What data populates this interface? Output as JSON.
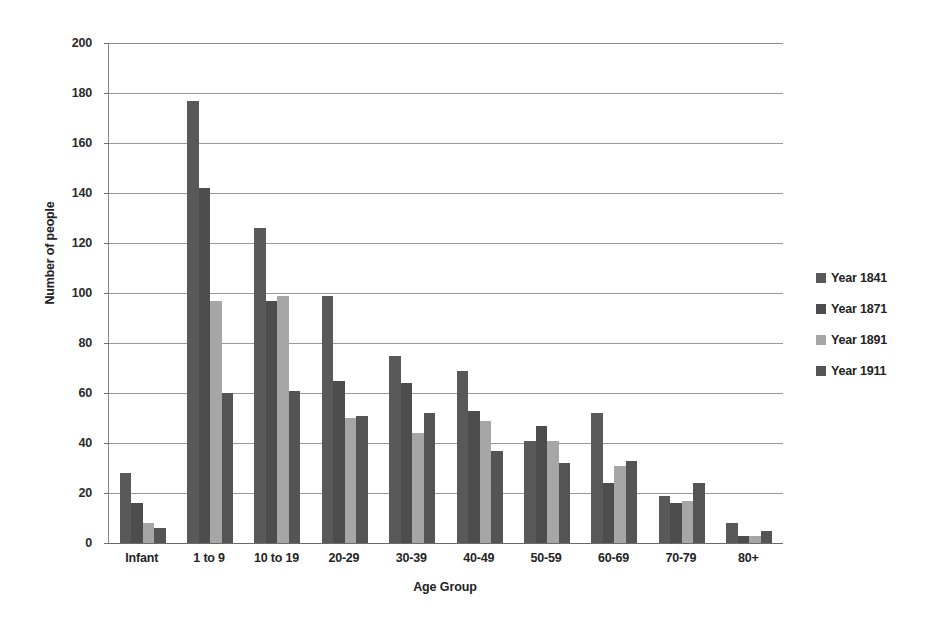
{
  "chart_data": {
    "type": "bar",
    "title": "",
    "xlabel": "Age Group",
    "ylabel": "Number of people",
    "categories": [
      "Infant",
      "1 to 9",
      "10 to 19",
      "20-29",
      "30-39",
      "40-49",
      "50-59",
      "60-69",
      "70-79",
      "80+"
    ],
    "series": [
      {
        "name": "Year 1841",
        "color": "#595959",
        "values": [
          28,
          177,
          126,
          99,
          75,
          69,
          41,
          52,
          19,
          8
        ]
      },
      {
        "name": "Year 1871",
        "color": "#4d4d4d",
        "values": [
          16,
          142,
          97,
          65,
          64,
          53,
          47,
          24,
          16,
          3
        ]
      },
      {
        "name": "Year 1891",
        "color": "#a6a6a6",
        "values": [
          8,
          97,
          99,
          50,
          44,
          49,
          41,
          31,
          17,
          3
        ]
      },
      {
        "name": "Year 1911",
        "color": "#545454",
        "values": [
          6,
          60,
          61,
          51,
          52,
          37,
          32,
          33,
          24,
          5
        ]
      }
    ],
    "ylim": [
      0,
      200
    ],
    "yticks": [
      0,
      20,
      40,
      60,
      80,
      100,
      120,
      140,
      160,
      180,
      200
    ],
    "grid": true,
    "legend_position": "right"
  }
}
